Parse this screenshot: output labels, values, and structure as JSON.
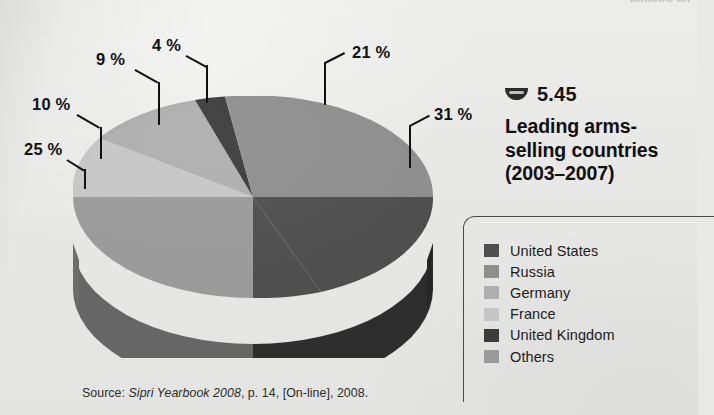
{
  "figure": {
    "number_marker_icon": "half-circle-bowl-icon",
    "number": "5.45",
    "title_line1": "Leading arms-",
    "title_line2": "selling countries",
    "title_line3": "(2003–2007)",
    "source": {
      "prefix": "Source: ",
      "italic": "Sipri Yearbook 2008",
      "suffix": ", p. 14, [On-line], 2008."
    },
    "top_cut_text": "nrunucs nu"
  },
  "colors": {
    "background": "#e9e9e7",
    "text": "#111111",
    "legend_border": "#4a4a4a",
    "slice_united_states": "#4f4f4f",
    "slice_russia": "#8e8e8e",
    "slice_germany": "#aeaeae",
    "slice_france": "#c6c6c6",
    "slice_united_kingdom": "#3c3c3c",
    "slice_others": "#9a9a9a",
    "side_united_states": "#2e2e2e",
    "side_russia": "#5f5f5f",
    "side_germany": "#747474",
    "side_france": "#858585",
    "side_others": "#666666"
  },
  "legend": {
    "items": [
      {
        "label": "United States",
        "color": "#4f4f4f"
      },
      {
        "label": "Russia",
        "color": "#8e8e8e"
      },
      {
        "label": "Germany",
        "color": "#aeaeae"
      },
      {
        "label": "France",
        "color": "#c6c6c6"
      },
      {
        "label": "United Kingdom",
        "color": "#3c3c3c"
      },
      {
        "label": "Others",
        "color": "#9a9a9a"
      }
    ]
  },
  "chart_data": {
    "type": "pie",
    "style": "3d-pie",
    "unit": "%",
    "legend_position": "right",
    "grid": false,
    "categories": [
      "United States",
      "Russia",
      "Germany",
      "France",
      "United Kingdom",
      "Others"
    ],
    "values": [
      31,
      21,
      9,
      4,
      10,
      25
    ],
    "labels": [
      "31 %",
      "21 %",
      "9 %",
      "4 %",
      "10 %",
      "25 %"
    ],
    "colors": [
      "#4f4f4f",
      "#8e8e8e",
      "#aeaeae",
      "#c6c6c6",
      "#3c3c3c",
      "#9a9a9a"
    ],
    "annotations": [
      {
        "text": "21 %",
        "value": 21,
        "series": "Russia"
      },
      {
        "text": "31 %",
        "value": 31,
        "series": "United States"
      },
      {
        "text": "4 %",
        "value": 4,
        "series": "United Kingdom"
      },
      {
        "text": "9 %",
        "value": 9,
        "series": "Germany"
      },
      {
        "text": "10 %",
        "value": 10,
        "series": "France"
      },
      {
        "text": "25 %",
        "value": 25,
        "series": "Others"
      }
    ],
    "source": "Source: Sipri Yearbook 2008, p. 14, [On-line], 2008."
  },
  "pct_labels": {
    "p21": "21 %",
    "p31": "31 %",
    "p4": "4 %",
    "p9": "9 %",
    "p10": "10 %",
    "p25": "25 %"
  }
}
